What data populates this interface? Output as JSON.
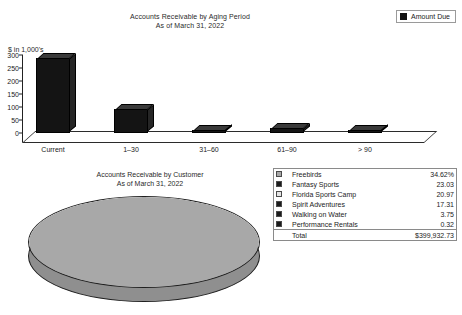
{
  "bar_panel": {
    "title": "Accounts Receivable by Aging Period",
    "subtitle": "As of March 31, 2022",
    "y_caption": "$ in 1,000's",
    "legend_label": "Amount Due"
  },
  "pie_panel": {
    "title": "Accounts Receivable by Customer",
    "subtitle": "As of March 31, 2022",
    "total_label": "Total",
    "total_value": "$399,932.73"
  },
  "chart_data": [
    {
      "type": "bar",
      "title": "Accounts Receivable by Aging Period",
      "subtitle": "As of March 31, 2022",
      "xlabel": "",
      "ylabel": "$ in 1,000's",
      "ylim": [
        0,
        300
      ],
      "yticks": [
        0,
        50,
        100,
        150,
        200,
        250,
        300
      ],
      "grid": false,
      "legend": [
        "Amount Due"
      ],
      "legend_position": "top-right",
      "categories": [
        "Current",
        "1–30",
        "31–60",
        "61–90",
        "> 90"
      ],
      "series": [
        {
          "name": "Amount Due",
          "color": "#141414",
          "values": [
            290,
            92,
            12,
            18,
            13
          ]
        }
      ]
    },
    {
      "type": "pie",
      "title": "Accounts Receivable by Customer",
      "subtitle": "As of March 31, 2022",
      "labels": [
        "Freebirds",
        "Fantasy Sports",
        "Florida Sports Camp",
        "Spirit Adventures",
        "Walking on Water",
        "Performance Rentals"
      ],
      "values": [
        34.62,
        23.03,
        20.97,
        17.31,
        3.75,
        0.32
      ],
      "unit": "%",
      "colors": [
        "#a8a8a8",
        "#1c1c1c",
        "#e4e4e4",
        "#1c1c1c",
        "#1c1c1c",
        "#1c1c1c"
      ],
      "total": "$399,932.73"
    }
  ],
  "pie_legend_rows": [
    {
      "swatch": "#a8a8a8",
      "label": "Freebirds",
      "value": "34.62%"
    },
    {
      "swatch": "#1c1c1c",
      "label": "Fantasy Sports",
      "value": "23.03"
    },
    {
      "swatch": "#e4e4e4",
      "label": "Florida Sports Camp",
      "value": "20.97"
    },
    {
      "swatch": "#1c1c1c",
      "label": "Spirit Adventures",
      "value": "17.31"
    },
    {
      "swatch": "#1c1c1c",
      "label": "Walking on Water",
      "value": "3.75"
    },
    {
      "swatch": "#1c1c1c",
      "label": "Performance Rentals",
      "value": "0.32"
    }
  ]
}
